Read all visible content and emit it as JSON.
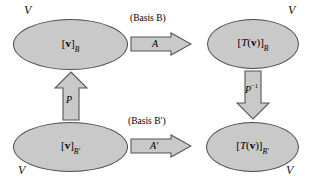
{
  "diagram": {
    "colors": {
      "shape_fill": "#c9c9c9",
      "shape_stroke": "#4a4a4a",
      "text": "#000000",
      "background": "#ffffff"
    },
    "spaces": [
      {
        "id": "top-left",
        "space_label": "V",
        "content": "[v]",
        "content_sub": "B",
        "bracket_open": "[",
        "vector": "v",
        "bracket_close": "]"
      },
      {
        "id": "top-right",
        "space_label": "V",
        "content": "[T(v)]",
        "content_sub": "B",
        "bracket_open": "[",
        "map": "T",
        "paren_open": "(",
        "vector": "v",
        "paren_close": ")",
        "bracket_close": "]"
      },
      {
        "id": "bottom-left",
        "space_label": "V",
        "content": "[v]",
        "content_sub": "B′",
        "bracket_open": "[",
        "vector": "v",
        "bracket_close": "]"
      },
      {
        "id": "bottom-right",
        "space_label": "V",
        "content": "[T(v)]",
        "content_sub": "B′",
        "bracket_open": "[",
        "map": "T",
        "paren_open": "(",
        "vector": "v",
        "paren_close": ")",
        "bracket_close": "]"
      }
    ],
    "annotations": [
      {
        "id": "basis-top",
        "prefix": "(Basis ",
        "symbol": "B",
        "suffix": ")",
        "full": "(Basis B)"
      },
      {
        "id": "basis-bottom",
        "prefix": "(Basis ",
        "symbol": "B′",
        "suffix": ")",
        "full": "(Basis B′)"
      }
    ],
    "arrows": [
      {
        "id": "arrow-A",
        "label": "A",
        "direction": "right"
      },
      {
        "id": "arrow-A-prime",
        "label": "A′",
        "direction": "right"
      },
      {
        "id": "arrow-P",
        "label": "P",
        "direction": "up"
      },
      {
        "id": "arrow-P-inverse",
        "label": "P",
        "exponent": "−1",
        "direction": "down"
      }
    ]
  }
}
